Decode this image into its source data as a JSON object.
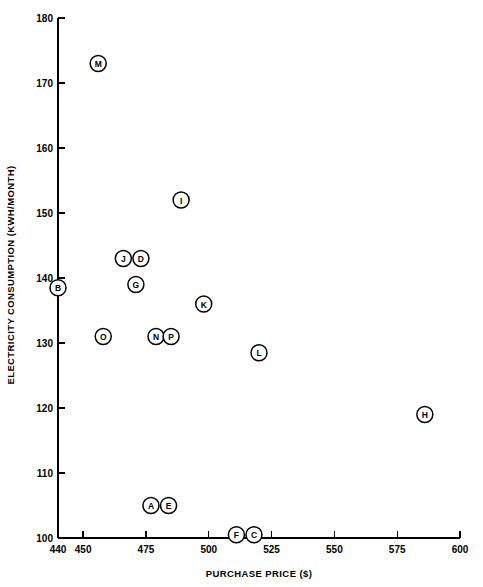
{
  "chart_data": {
    "type": "scatter",
    "title": "",
    "xlabel": "PURCHASE PRICE ($)",
    "ylabel": "ELECTRICITY CONSUMPTION (KWH/MONTH)",
    "xlim": [
      440,
      600
    ],
    "ylim": [
      100,
      180
    ],
    "grid": false,
    "legend": "none",
    "point_marker": "circled-letter",
    "xticks": [
      440,
      450,
      475,
      500,
      525,
      550,
      575,
      600
    ],
    "xtick_labels": [
      "440",
      "450",
      "475",
      "500",
      "525",
      "550",
      "575",
      "600"
    ],
    "yticks": [
      100,
      110,
      120,
      130,
      140,
      150,
      160,
      170,
      180
    ],
    "ytick_labels": [
      "100",
      "110",
      "120",
      "130",
      "140",
      "150",
      "160",
      "170",
      "180"
    ],
    "points": [
      {
        "label": "A",
        "x": 477,
        "y": 105.0
      },
      {
        "label": "B",
        "x": 440,
        "y": 138.5
      },
      {
        "label": "C",
        "x": 518,
        "y": 100.5
      },
      {
        "label": "D",
        "x": 473,
        "y": 143.0
      },
      {
        "label": "E",
        "x": 484,
        "y": 105.0
      },
      {
        "label": "F",
        "x": 511,
        "y": 100.5
      },
      {
        "label": "G",
        "x": 471,
        "y": 139.0
      },
      {
        "label": "H",
        "x": 586,
        "y": 119.0
      },
      {
        "label": "I",
        "x": 489,
        "y": 152.0
      },
      {
        "label": "J",
        "x": 466,
        "y": 143.0
      },
      {
        "label": "K",
        "x": 498,
        "y": 136.0
      },
      {
        "label": "L",
        "x": 520,
        "y": 128.5
      },
      {
        "label": "M",
        "x": 456,
        "y": 173.0
      },
      {
        "label": "N",
        "x": 479,
        "y": 131.0
      },
      {
        "label": "O",
        "x": 458,
        "y": 131.0
      },
      {
        "label": "P",
        "x": 485,
        "y": 131.0
      }
    ]
  }
}
